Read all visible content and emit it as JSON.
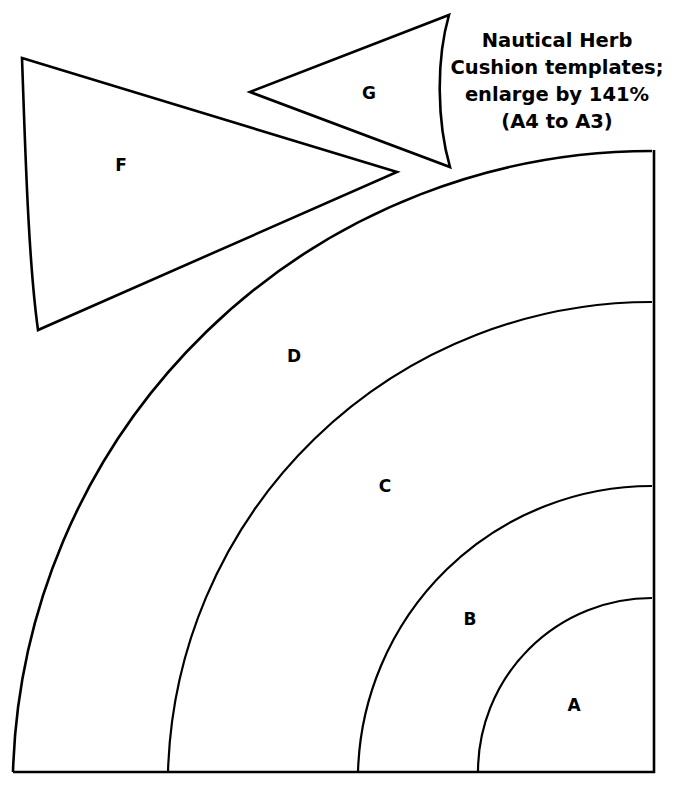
{
  "document": {
    "title": "Nautical Herb Cushion templates",
    "type": "sewing-pattern-template-sheet",
    "background_color": "#ffffff",
    "line_color": "#000000"
  },
  "note": {
    "name": "instruction-note",
    "lines": [
      "Nautical Herb",
      "Cushion templates;",
      "enlarge by 141%",
      "(A4 to A3)"
    ],
    "full_text": "Nautical Herb Cushion templates; enlarge by 141% (A4 to A3)",
    "enlargement_percent": "141%",
    "paper_from": "A4",
    "paper_to": "A3",
    "x": 557,
    "y": 42
  },
  "pieces": [
    {
      "id": "A",
      "label": "A",
      "shape": "quarter-annulus-core",
      "label_x": 574,
      "label_y": 706,
      "outer_radius": 174
    },
    {
      "id": "B",
      "label": "B",
      "shape": "quarter-annulus",
      "label_x": 470,
      "label_y": 620,
      "inner_radius": 174,
      "outer_radius": 294
    },
    {
      "id": "C",
      "label": "C",
      "shape": "quarter-annulus",
      "label_x": 385,
      "label_y": 487,
      "inner_radius": 294,
      "outer_radius": 484
    },
    {
      "id": "D",
      "label": "D",
      "shape": "quarter-annulus",
      "label_x": 294,
      "label_y": 357,
      "inner_radius": 484,
      "outer_radius": 639
    },
    {
      "id": "F",
      "label": "F",
      "shape": "curved-triangle",
      "label_x": 121,
      "label_y": 166
    },
    {
      "id": "G",
      "label": "G",
      "shape": "curved-triangle",
      "label_x": 369,
      "label_y": 94
    }
  ],
  "geometry": {
    "arc_center_x": 652,
    "arc_center_y": 772,
    "square_left": 13,
    "square_top": 150,
    "square_right": 652,
    "square_bottom": 772,
    "arc_radii": [
      174,
      294,
      484,
      639
    ]
  }
}
